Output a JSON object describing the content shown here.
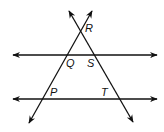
{
  "diagram": {
    "type": "geometry",
    "labels": {
      "R": "R",
      "Q": "Q",
      "S": "S",
      "P": "P",
      "T": "T"
    },
    "points": {
      "R": [
        80,
        32
      ],
      "Q": [
        68,
        55
      ],
      "S": [
        94,
        55
      ],
      "P": [
        43,
        99
      ],
      "T": [
        119,
        99
      ]
    },
    "lines": [
      {
        "name": "upper-parallel",
        "from": [
          13,
          55
        ],
        "to": [
          157,
          55
        ]
      },
      {
        "name": "lower-parallel",
        "from": [
          13,
          99
        ],
        "to": [
          157,
          99
        ]
      },
      {
        "name": "transversal-PQR",
        "from": [
          29,
          123
        ],
        "to": [
          92,
          11
        ]
      },
      {
        "name": "transversal-RST",
        "from": [
          69,
          11
        ],
        "to": [
          133,
          122
        ]
      }
    ],
    "stroke_color": "#111111"
  }
}
